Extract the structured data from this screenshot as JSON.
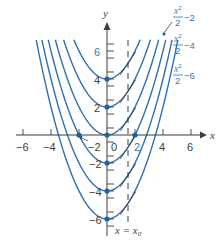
{
  "chart_data": {
    "type": "line",
    "title": "",
    "xlabel": "x",
    "ylabel": "y",
    "xlim": [
      -6.5,
      7
    ],
    "ylim": [
      -7,
      7
    ],
    "grid": false,
    "x_ticks": [
      -6,
      -4,
      -2,
      0,
      2,
      4,
      6
    ],
    "x_tick_labels": [
      "−6",
      "−4",
      "−2",
      "0",
      "2",
      "4",
      "6"
    ],
    "y_ticks": [
      -6,
      -4,
      -2,
      2,
      4,
      6
    ],
    "y_tick_labels": [
      "−6",
      "−4",
      "−2",
      "2",
      "4",
      "6"
    ],
    "series": [
      {
        "name": "x²/2 + 4",
        "constant": 4,
        "vertex": [
          0,
          4
        ]
      },
      {
        "name": "x²/2 + 2",
        "constant": 2,
        "vertex": [
          0,
          2
        ]
      },
      {
        "name": "x²/2",
        "constant": 0,
        "vertex": [
          0,
          0
        ]
      },
      {
        "name": "x²/2 − 2",
        "constant": -2,
        "vertex": [
          0,
          -2
        ]
      },
      {
        "name": "x²/2 − 4",
        "constant": -4,
        "vertex": [
          0,
          -4
        ]
      },
      {
        "name": "x²/2 − 6",
        "constant": -6,
        "vertex": [
          0,
          -6
        ]
      }
    ],
    "marked_points": [
      [
        0,
        4
      ],
      [
        0,
        2
      ],
      [
        0,
        0
      ],
      [
        0,
        -2
      ],
      [
        0,
        -4
      ],
      [
        0,
        -6
      ],
      [
        -2,
        0
      ],
      [
        2,
        0
      ]
    ],
    "annotations": [
      {
        "text": "x²/2 − 2",
        "position": "top-right"
      },
      {
        "text": "x²/2 − 4",
        "position": "right"
      },
      {
        "text": "x²/2 − 6",
        "position": "right"
      },
      {
        "text": "x = x₀",
        "position": "bottom, next to dashed line"
      }
    ],
    "vertical_line": {
      "x": 1.5,
      "style": "dashed",
      "label": "x = x₀"
    },
    "tangent_slope_at_x0": 1.5
  },
  "labels": {
    "x_axis": "x",
    "y_axis": "y",
    "x0_line_lhs": "x = x",
    "x0_line_sub": "0",
    "curve_labels": [
      {
        "num": "x",
        "sup": "2",
        "den": "2",
        "tail": "−2"
      },
      {
        "num": "x",
        "sup": "2",
        "den": "2",
        "tail": "−4"
      },
      {
        "num": "x",
        "sup": "2",
        "den": "2",
        "tail": "−6"
      }
    ],
    "x_ticks": [
      "−6",
      "−4",
      "−2",
      "0",
      "2",
      "4",
      "6"
    ],
    "y_ticks": [
      "6",
      "4",
      "2",
      "−2",
      "−4",
      "−6"
    ]
  },
  "colors": {
    "curve": "#2f6fb3",
    "dot": "#1f62a8",
    "axis": "#3d3d3d",
    "label": "#2f7cc0"
  }
}
